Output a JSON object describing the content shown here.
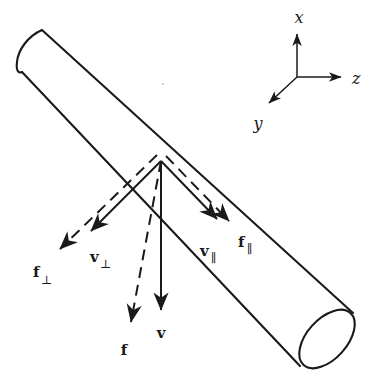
{
  "figure": {
    "title": "",
    "background_color": "#ffffff",
    "stroke_color": "#1a1a1a"
  },
  "axes": {
    "origin": {
      "x": 297,
      "y": 77
    },
    "labels": {
      "x": "x",
      "y": "y",
      "z": "z"
    },
    "x_axis": {
      "tip_x": 297,
      "tip_y": 28,
      "label_x": 299,
      "label_y": 20
    },
    "z_axis": {
      "tip_x": 347,
      "tip_y": 77,
      "label_x": 355,
      "label_y": 83
    },
    "y_axis": {
      "tip_x": 264,
      "tip_y": 107,
      "label_x": 256,
      "label_y": 126
    }
  },
  "cylinder": {
    "axis_angle_deg": 45,
    "top_cap_label": "closed-rounded-end",
    "bottom_cap_label": "open-elliptical-end",
    "upper_edge": {
      "x1": 42,
      "y1": 30,
      "x2": 353,
      "y2": 313
    },
    "lower_edge": {
      "x1": 22,
      "y1": 72,
      "x2": 300,
      "y2": 366
    }
  },
  "vectors": {
    "origin": {
      "x": 161,
      "y": 161
    },
    "items": [
      {
        "name": "v",
        "label": "v",
        "subscript": "",
        "style": "solid",
        "tip_x": 161,
        "tip_y": 318,
        "label_x": 161,
        "label_y": 338,
        "meaning": "total velocity"
      },
      {
        "name": "f",
        "label": "f",
        "subscript": "",
        "style": "dashed",
        "tip_x": 128,
        "tip_y": 331,
        "label_x": 124,
        "label_y": 355,
        "meaning": "total drag force"
      },
      {
        "name": "v-perp",
        "label": "v",
        "subscript": "⊥",
        "style": "solid",
        "tip_x": 84,
        "tip_y": 237,
        "label_x": 90,
        "label_y": 262,
        "meaning": "velocity component perpendicular to rod axis"
      },
      {
        "name": "f-perp",
        "label": "f",
        "subscript": "⊥",
        "style": "dashed",
        "tip_x": 52,
        "tip_y": 256,
        "label_x": 33,
        "label_y": 277,
        "meaning": "force component perpendicular to rod axis"
      },
      {
        "name": "v-par",
        "label": "v",
        "subscript": "∥",
        "style": "solid",
        "tip_x": 224,
        "tip_y": 226,
        "label_x": 205,
        "label_y": 255,
        "meaning": "velocity component parallel to rod axis"
      },
      {
        "name": "f-par",
        "label": "f",
        "subscript": "∥",
        "style": "dashed",
        "tip_x": 236,
        "tip_y": 228,
        "label_x": 241,
        "label_y": 246,
        "meaning": "force component parallel to rod axis"
      }
    ]
  },
  "artifact": {
    "speck": {
      "x": 163,
      "y": 84
    }
  }
}
